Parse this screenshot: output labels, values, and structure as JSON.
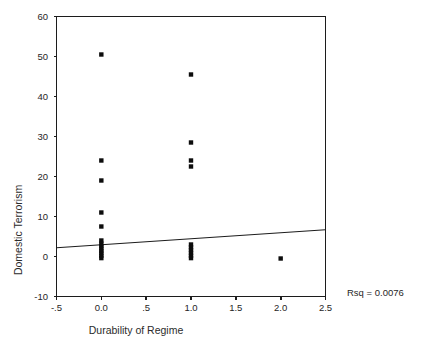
{
  "chart_data": {
    "type": "scatter",
    "title": "",
    "xlabel": "Durability of Regime",
    "ylabel": "Domestic Terrorism",
    "xlim": [
      -0.5,
      2.5
    ],
    "ylim": [
      -10,
      60
    ],
    "grid": false,
    "legend": null,
    "xticks": [
      -0.5,
      0.0,
      0.5,
      1.0,
      1.5,
      2.0,
      2.5
    ],
    "xticklabels": [
      "-.5",
      "0.0",
      ".5",
      "1.0",
      "1.5",
      "2.0",
      "2.5"
    ],
    "yticks": [
      -10,
      0,
      10,
      20,
      30,
      40,
      50,
      60
    ],
    "yticklabels": [
      "-10",
      "0",
      "10",
      "20",
      "30",
      "40",
      "50",
      "60"
    ],
    "annotations": [
      {
        "name": "rsq",
        "text": "Rsq = 0.0076",
        "value": 0.0076
      }
    ],
    "series": [
      {
        "name": "observations",
        "marker": "square",
        "points": [
          {
            "x": 0.0,
            "y": 50.5
          },
          {
            "x": 0.0,
            "y": 24.0
          },
          {
            "x": 0.0,
            "y": 19.0
          },
          {
            "x": 0.0,
            "y": 11.0
          },
          {
            "x": 0.0,
            "y": 7.5
          },
          {
            "x": 0.0,
            "y": 4.0
          },
          {
            "x": 0.0,
            "y": 3.2
          },
          {
            "x": 0.0,
            "y": 2.6
          },
          {
            "x": 0.0,
            "y": 2.0
          },
          {
            "x": 0.0,
            "y": 1.4
          },
          {
            "x": 0.0,
            "y": 0.8
          },
          {
            "x": 0.0,
            "y": 0.2
          },
          {
            "x": 0.0,
            "y": -0.4
          },
          {
            "x": 1.0,
            "y": 45.5
          },
          {
            "x": 1.0,
            "y": 28.5
          },
          {
            "x": 1.0,
            "y": 24.0
          },
          {
            "x": 1.0,
            "y": 22.5
          },
          {
            "x": 1.0,
            "y": 3.0
          },
          {
            "x": 1.0,
            "y": 2.3
          },
          {
            "x": 1.0,
            "y": 1.6
          },
          {
            "x": 1.0,
            "y": 0.9
          },
          {
            "x": 1.0,
            "y": 0.2
          },
          {
            "x": 1.0,
            "y": -0.4
          },
          {
            "x": 2.0,
            "y": -0.5
          }
        ]
      }
    ],
    "fit_line": {
      "name": "linear-fit",
      "x_start": -0.5,
      "y_start": 2.2,
      "x_end": 2.5,
      "y_end": 6.7,
      "slope": 1.5,
      "intercept": 2.95
    }
  }
}
